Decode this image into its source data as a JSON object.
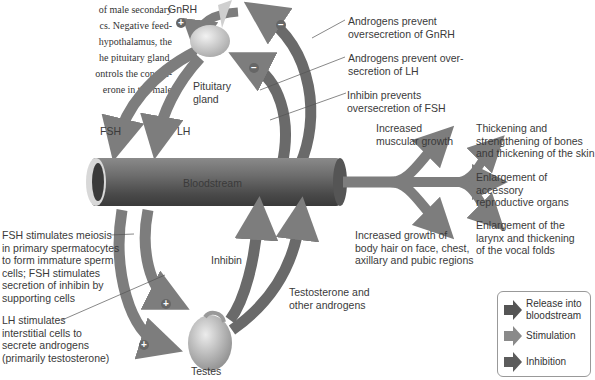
{
  "intro_text": "of male secondary\ncs. Negative feed-\nhypothalamus, the\nhe pituitary gland,\nontrols the concen-\nerone in the male",
  "labels": {
    "gnrh": "GnRH",
    "pituitary": "Pituitary\ngland",
    "fsh": "FSH",
    "lh": "LH",
    "bloodstream": "Bloodstream",
    "inhibin": "Inhibin",
    "testosterone": "Testosterone and\nother androgens",
    "testes": "Testes"
  },
  "feedback_notes": [
    "Androgens prevent\noversecretion of GnRH",
    "Androgens prevent over-\nsecretion of LH",
    "Inhibin prevents\noversecretion of FSH"
  ],
  "effects": {
    "muscular": "Increased\nmuscular growth",
    "bones": "Thickening and\nstrengthening of bones\nand thickening of the skin",
    "organs": "Enlargement of\naccessory\nreproductive organs",
    "larynx": "Enlargement of the\nlarynx and thickening\nof the vocal folds",
    "hair": "Increased growth of\nbody hair on face, chest,\naxillary and pubic regions"
  },
  "testes_notes": {
    "fsh": "FSH stimulates meiosis\nin primary spermatocytes\nto form immature sperm\ncells; FSH stimulates\nsecretion of inhibin by\nsupporting cells",
    "lh": "LH stimulates\ninterstitial cells to\nsecrete androgens\n(primarily testosterone)"
  },
  "signs": {
    "plus": "+",
    "minus": "−"
  },
  "legend": {
    "items": [
      {
        "label": "Release into\nbloodstream",
        "color": "#555555"
      },
      {
        "label": "Stimulation",
        "color": "#8a8a8a"
      },
      {
        "label": "Inhibition",
        "color": "#5c5c5c"
      }
    ]
  },
  "colors": {
    "arrow": "#7d7d7d",
    "arrow_dark": "#6a6a6a",
    "vessel": "#5a5a5a"
  }
}
